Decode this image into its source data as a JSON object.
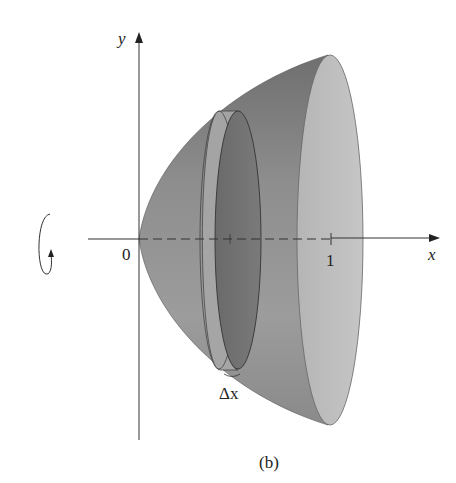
{
  "figure": {
    "caption": "(b)"
  },
  "axes": {
    "x_label": "x",
    "y_label": "y",
    "origin_label": "0",
    "x_tick_label": "1"
  },
  "annotations": {
    "slice_thickness": "Δx",
    "rotation_indicator": "rotation-about-x-axis"
  },
  "colors": {
    "background": "#ffffff",
    "solid_body": "#9a9a9a",
    "solid_top_dark": "#7d7d7d",
    "end_cap": "#bdbdbd",
    "disk_face": "#747474",
    "disk_rim": "#a8a8a8",
    "axis": "#333333"
  }
}
